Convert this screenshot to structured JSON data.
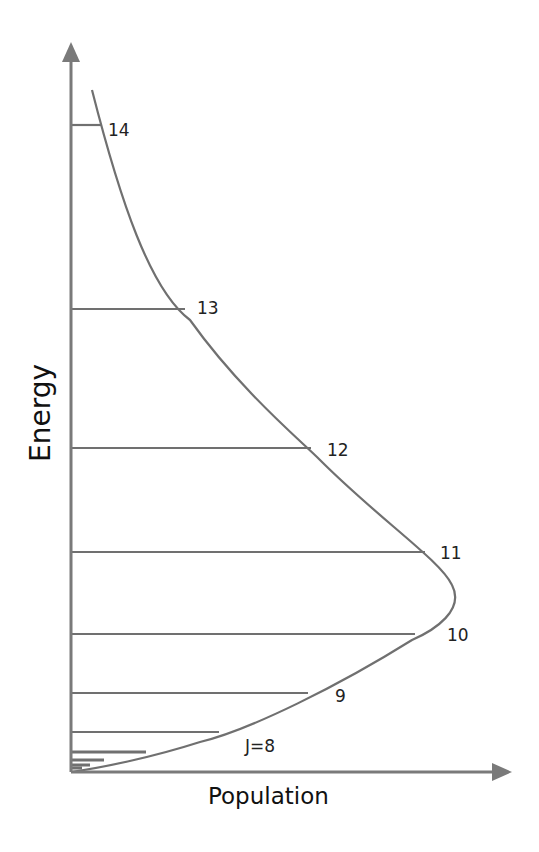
{
  "chart_data": {
    "type": "diagram",
    "title": "",
    "xlabel": "Population",
    "ylabel": "Energy",
    "colors": {
      "line": "#707070",
      "text": "#222222",
      "background": "#ffffff"
    },
    "axis": {
      "origin": [
        71,
        772
      ],
      "y_top": 42,
      "x_right": 512
    },
    "levels": [
      {
        "J": 14,
        "label": "14",
        "y": 125,
        "x_end": 101,
        "label_x": 108,
        "label_y": 131
      },
      {
        "J": 13,
        "label": "13",
        "y": 309,
        "x_end": 185,
        "label_x": 197,
        "label_y": 309
      },
      {
        "J": 12,
        "label": "12",
        "y": 448,
        "x_end": 311,
        "label_x": 327,
        "label_y": 451
      },
      {
        "J": 11,
        "label": "11",
        "y": 552,
        "x_end": 425,
        "label_x": 440,
        "label_y": 554
      },
      {
        "J": 10,
        "label": "10",
        "y": 634,
        "x_end": 415,
        "label_x": 447,
        "label_y": 636
      },
      {
        "J": 9,
        "label": "9",
        "y": 693,
        "x_end": 308,
        "label_x": 335,
        "label_y": 697
      },
      {
        "J": 8,
        "label": "J=8",
        "y": 732,
        "x_end": 219,
        "label_x": 245,
        "label_y": 747
      },
      {
        "J": 7,
        "label": "",
        "y": 752,
        "x_end": 146
      },
      {
        "J": 6,
        "label": "",
        "y": 760,
        "x_end": 104
      },
      {
        "J": 5,
        "label": "",
        "y": 765,
        "x_end": 90
      },
      {
        "J": 4,
        "label": "",
        "y": 768,
        "x_end": 82
      }
    ],
    "envelope_curve": "M 92 90 C 120 200, 150 290, 190 320 C 240 390, 300 440, 320 460 C 380 520, 440 560, 452 585 C 465 610, 435 630, 412 640 C 340 685, 250 730, 200 742 C 150 758, 100 768, 71 772"
  }
}
